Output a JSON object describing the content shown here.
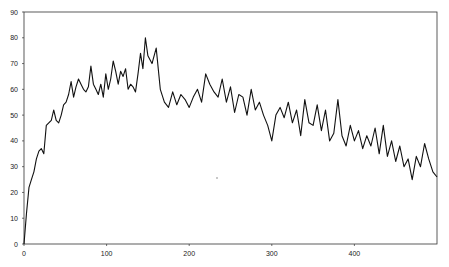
{
  "chart_data": {
    "type": "line",
    "title": "",
    "xlabel": "",
    "ylabel": "",
    "xlim": [
      0,
      500
    ],
    "ylim": [
      0,
      90
    ],
    "x_ticks": [
      0,
      100,
      200,
      300,
      400
    ],
    "y_ticks": [
      0,
      10,
      20,
      30,
      40,
      50,
      60,
      70,
      80,
      90
    ],
    "grid": false,
    "legend": null,
    "series": [
      {
        "name": "series-1",
        "color": "#111111",
        "x": [
          0,
          3,
          6,
          9,
          12,
          15,
          18,
          21,
          24,
          27,
          30,
          33,
          36,
          39,
          42,
          45,
          48,
          51,
          54,
          57,
          60,
          63,
          66,
          69,
          72,
          75,
          78,
          81,
          84,
          87,
          90,
          93,
          96,
          99,
          102,
          105,
          108,
          111,
          114,
          117,
          120,
          123,
          126,
          129,
          132,
          135,
          138,
          141,
          144,
          147,
          150,
          155,
          160,
          165,
          170,
          175,
          180,
          185,
          190,
          195,
          200,
          205,
          210,
          215,
          220,
          225,
          230,
          235,
          240,
          245,
          250,
          255,
          260,
          265,
          270,
          275,
          280,
          285,
          290,
          295,
          300,
          305,
          310,
          315,
          320,
          325,
          330,
          335,
          340,
          345,
          350,
          355,
          360,
          365,
          370,
          375,
          380,
          385,
          390,
          395,
          400,
          405,
          410,
          415,
          420,
          425,
          430,
          435,
          440,
          445,
          450,
          455,
          460,
          465,
          470,
          475,
          480,
          485,
          490,
          495,
          500
        ],
        "values": [
          0,
          12,
          22,
          25,
          28,
          33,
          36,
          37,
          35,
          46,
          47,
          48,
          52,
          48,
          47,
          50,
          54,
          55,
          58,
          63,
          57,
          61,
          64,
          62,
          60,
          59,
          61,
          69,
          62,
          60,
          58,
          62,
          57,
          66,
          60,
          64,
          71,
          67,
          62,
          67,
          65,
          68,
          60,
          62,
          61,
          59,
          66,
          74,
          68,
          80,
          73,
          70,
          76,
          60,
          55,
          53,
          59,
          54,
          58,
          56,
          53,
          57,
          60,
          55,
          66,
          62,
          59,
          57,
          64,
          55,
          61,
          51,
          58,
          57,
          50,
          60,
          52,
          55,
          50,
          46,
          40,
          50,
          53,
          49,
          55,
          47,
          52,
          42,
          56,
          47,
          46,
          54,
          44,
          52,
          40,
          43,
          56,
          42,
          38,
          46,
          40,
          44,
          37,
          42,
          38,
          45,
          35,
          46,
          34,
          40,
          32,
          38,
          30,
          33,
          25,
          34,
          30,
          39,
          33,
          28,
          26
        ]
      }
    ]
  }
}
